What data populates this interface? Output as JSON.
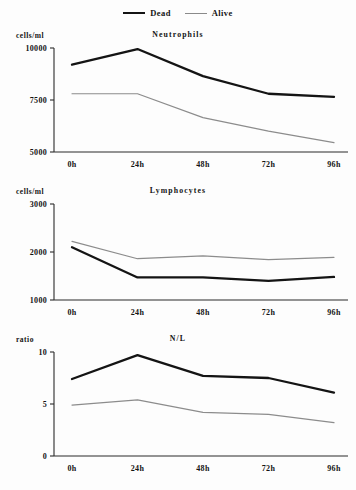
{
  "legend": {
    "entries": [
      {
        "label": "Dead",
        "color": "#141414",
        "width": 2.6
      },
      {
        "label": "Alive",
        "color": "#8c8c8c",
        "width": 1.4
      }
    ]
  },
  "chart_data": [
    {
      "id": "neutrophils",
      "type": "line",
      "title": "Neutrophils",
      "ylabel": "cells/ml",
      "xlabel": "",
      "categories": [
        "0h",
        "24h",
        "48h",
        "72h",
        "96h"
      ],
      "yticks": [
        "10000",
        "7500",
        "5000"
      ],
      "ytickvals": [
        10000,
        7500,
        5000
      ],
      "ylim": [
        5000,
        10000
      ],
      "grid": false,
      "legend_position": "top-center",
      "series": [
        {
          "name": "Dead",
          "values": [
            9200,
            9950,
            8650,
            7800,
            7650
          ]
        },
        {
          "name": "Alive",
          "values": [
            7800,
            7800,
            6650,
            6000,
            5450
          ]
        }
      ]
    },
    {
      "id": "lymphocytes",
      "type": "line",
      "title": "Lymphocytes",
      "ylabel": "cells/ml",
      "xlabel": "",
      "categories": [
        "0h",
        "24h",
        "48h",
        "72h",
        "96h"
      ],
      "yticks": [
        "3000",
        "2000",
        "1000"
      ],
      "ytickvals": [
        3000,
        2000,
        1000
      ],
      "ylim": [
        1000,
        3000
      ],
      "grid": false,
      "legend_position": "top-center",
      "series": [
        {
          "name": "Dead",
          "values": [
            2100,
            1470,
            1470,
            1400,
            1480
          ]
        },
        {
          "name": "Alive",
          "values": [
            2220,
            1860,
            1920,
            1840,
            1890
          ]
        }
      ]
    },
    {
      "id": "nl",
      "type": "line",
      "title": "N/L",
      "ylabel": "ratio",
      "xlabel": "",
      "categories": [
        "0h",
        "24h",
        "48h",
        "72h",
        "96h"
      ],
      "yticks": [
        "10",
        "5",
        "0"
      ],
      "ytickvals": [
        10,
        5,
        0
      ],
      "ylim": [
        0,
        10
      ],
      "grid": false,
      "legend_position": "top-center",
      "series": [
        {
          "name": "Dead",
          "values": [
            7.4,
            9.7,
            7.7,
            7.5,
            6.1
          ]
        },
        {
          "name": "Alive",
          "values": [
            4.9,
            5.4,
            4.2,
            4.0,
            3.2
          ]
        }
      ]
    }
  ]
}
